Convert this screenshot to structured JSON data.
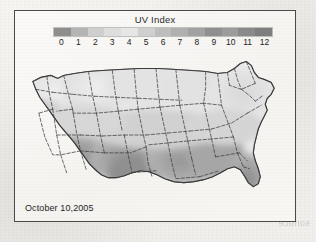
{
  "figure": {
    "caption_date": "October 10,2005",
    "bleed_text": "sonuce"
  },
  "legend": {
    "title": "UV Index",
    "ticks": [
      "0",
      "1",
      "2",
      "3",
      "4",
      "5",
      "6",
      "7",
      "8",
      "9",
      "10",
      "11",
      "12"
    ],
    "swatches": [
      "#8e8e8e",
      "#b4b4b4",
      "#cfcfcf",
      "#dedede",
      "#e6e6e6",
      "#cfcfcf",
      "#bdbdbd",
      "#b0b0b0",
      "#a2a2a2",
      "#8f8f8f",
      "#9c9c9c",
      "#8a8a8a",
      "#7e7e7e"
    ]
  },
  "chart_data": {
    "type": "heatmap",
    "title": "UV Index",
    "subtitle": "October 10,2005",
    "region": "Contiguous United States",
    "colorbar_label": "UV Index",
    "vmin": 0,
    "vmax": 12,
    "tick_values": [
      0,
      1,
      2,
      3,
      4,
      5,
      6,
      7,
      8,
      9,
      10,
      11,
      12
    ],
    "colormap": "grayscale",
    "grid": false,
    "legend_position": "top",
    "regional_values": [
      {
        "region": "Pacific Northwest",
        "value": 2
      },
      {
        "region": "Northern Rockies",
        "value": 3
      },
      {
        "region": "Northern Plains",
        "value": 3
      },
      {
        "region": "Upper Midwest",
        "value": 3
      },
      {
        "region": "Northeast",
        "value": 3
      },
      {
        "region": "Great Lakes",
        "value": 3
      },
      {
        "region": "Northern California",
        "value": 4
      },
      {
        "region": "Central Plains",
        "value": 5
      },
      {
        "region": "Ohio Valley",
        "value": 4
      },
      {
        "region": "Mid-Atlantic",
        "value": 4
      },
      {
        "region": "Southern California",
        "value": 6
      },
      {
        "region": "Desert Southwest",
        "value": 7
      },
      {
        "region": "Southern Plains",
        "value": 7
      },
      {
        "region": "Gulf Coast",
        "value": 8
      },
      {
        "region": "Southeast",
        "value": 8
      },
      {
        "region": "South Texas",
        "value": 9
      },
      {
        "region": "South Florida",
        "value": 9
      }
    ]
  }
}
